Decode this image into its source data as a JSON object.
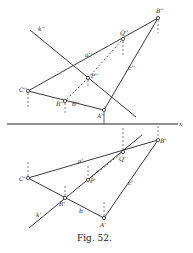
{
  "figure": {
    "caption": "Fig. 52.",
    "axis_label": "x",
    "upper_view": {
      "labels": {
        "k": "k''",
        "a": "a''",
        "c": "c''",
        "b": "b''",
        "A": "A''",
        "B": "B''",
        "C": "C''",
        "P": "P''",
        "Q": "Q''",
        "R": "R''"
      }
    },
    "lower_view": {
      "labels": {
        "k": "k'",
        "a": "a'",
        "c": "c'",
        "b": "b",
        "A": "A'",
        "B": "B'",
        "C": "C'",
        "P": "P'",
        "Q": "Q'",
        "R": "R'"
      }
    }
  }
}
